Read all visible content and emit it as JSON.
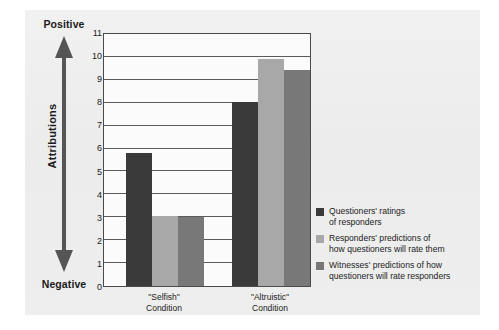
{
  "chart_data": {
    "type": "bar",
    "title": "",
    "xlabel": "",
    "ylabel": "Attributions",
    "ylim": [
      0,
      11
    ],
    "grid": true,
    "legend_position": "right",
    "axis_direction": {
      "top_label": "Positive",
      "bottom_label": "Negative",
      "axis_name": "Attributions"
    },
    "yticks": [
      11,
      10,
      9,
      8,
      7,
      6,
      5,
      4,
      3,
      2,
      1,
      0
    ],
    "categories": [
      {
        "line1": "\"Selfish\"",
        "line2": "Condition"
      },
      {
        "line1": "\"Altruistic\"",
        "line2": "Condition"
      }
    ],
    "series": [
      {
        "name": "Questioners' ratings of responders",
        "legend_line1": "Questioners' ratings",
        "legend_line2": "of responders",
        "color": "#3a3a3a",
        "values": [
          5.8,
          8.05
        ]
      },
      {
        "name": "Responders' predictions of how questioners will rate them",
        "legend_line1": "Responders' predictions of",
        "legend_line2": "how questioners will rate them",
        "color": "#a8a8a8",
        "values": [
          3.05,
          9.9
        ]
      },
      {
        "name": "Witnesses' predictions of how questioners will rate responders",
        "legend_line1": "Witnesses' predictions of how",
        "legend_line2": "questioners will rate responders",
        "color": "#787878",
        "values": [
          3.0,
          9.45
        ]
      }
    ]
  }
}
